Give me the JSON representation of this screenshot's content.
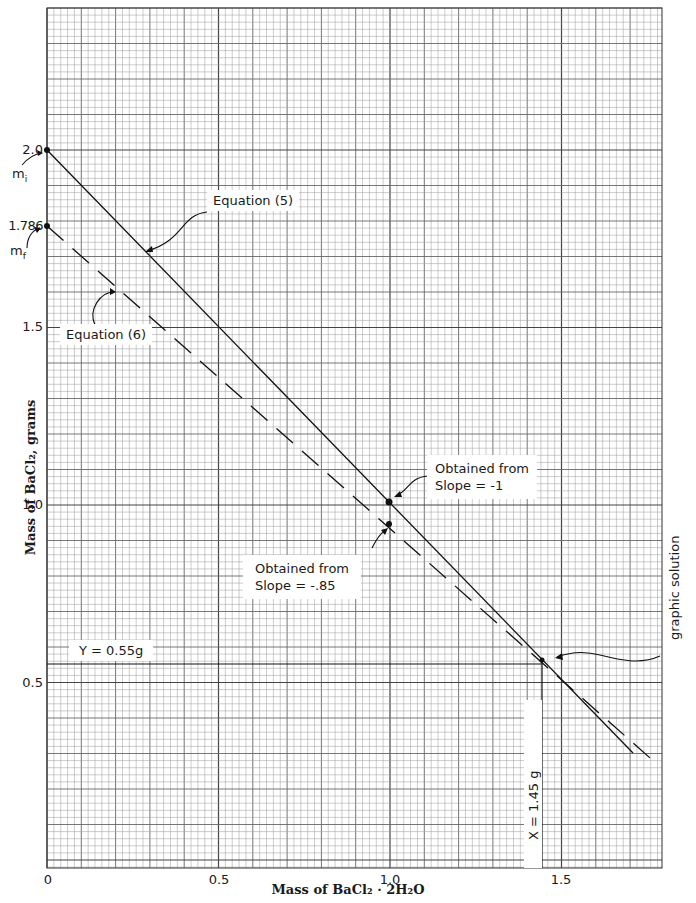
{
  "chart_data": {
    "type": "line",
    "title": "",
    "xlabel": "Mass of BaCl₂·2H₂O",
    "ylabel": "Mass of BaCl₂, grams",
    "xlim": [
      0,
      1.79
    ],
    "ylim": [
      0,
      2.42
    ],
    "grid": true,
    "x_ticks": [
      "0",
      "0.5",
      "1.0",
      "1.5"
    ],
    "x_tick_values": [
      0,
      0.5,
      1.0,
      1.5
    ],
    "y_ticks": [
      "0.5",
      "1.0",
      "1.5",
      "2.0"
    ],
    "y_tick_values": [
      0.5,
      1.0,
      1.5,
      2.0
    ],
    "series": [
      {
        "name": "Equation (5)",
        "style": "solid",
        "slope": -1,
        "intercept": 2.0,
        "x": [
          0,
          1.71
        ],
        "y": [
          2.0,
          0.29
        ]
      },
      {
        "name": "Equation (6)",
        "style": "dashed",
        "slope": -0.85,
        "intercept": 1.786,
        "x": [
          0,
          1.78
        ],
        "y": [
          1.786,
          0.273
        ]
      }
    ],
    "points": [
      {
        "x": 0,
        "y": 2.0,
        "label": "2.0"
      },
      {
        "x": 0,
        "y": 1.786,
        "label": "1.786"
      },
      {
        "x": 1.0,
        "y": 1.0
      },
      {
        "x": 1.0,
        "y": 0.936
      },
      {
        "x": 1.45,
        "y": 0.55
      }
    ],
    "annotations": [
      {
        "text": "mᵢ",
        "target": "2.0"
      },
      {
        "text": "mᶠ",
        "target": "1.786"
      },
      {
        "text": "Equation (5)"
      },
      {
        "text": "Equation (6)"
      },
      {
        "text": "Obtained from\nSlope = -1"
      },
      {
        "text": "Obtained from\nSlope = -.85"
      },
      {
        "text": "Y = 0.55g"
      },
      {
        "text": "X = 1.45 g"
      },
      {
        "text": "graphic solution"
      }
    ]
  },
  "labels": {
    "y_tick_2_0": "2.0",
    "y_tick_1_786": "1.786",
    "y_tick_1_5": "1.5",
    "y_tick_1_0": "1.0",
    "y_tick_0_5": "0.5",
    "x_tick_0": "0",
    "x_tick_0_5": "0.5",
    "x_tick_1_0": "1.0",
    "x_tick_1_5": "1.5",
    "m_i": "m",
    "m_i_sub": "i",
    "m_f": "m",
    "m_f_sub": "f",
    "eq5": "Equation (5)",
    "eq6": "Equation (6)",
    "obtained1_line1": "Obtained from",
    "obtained1_line2": "Slope = -1",
    "obtained2_line1": "Obtained from",
    "obtained2_line2": "Slope = -.85",
    "y_solution": "Y = 0.55g",
    "x_solution": "X = 1.45 g",
    "graphic_solution": "graphic solution",
    "ylabel": "Mass of BaCl₂, grams",
    "xlabel": "Mass of BaCl₂ · 2H₂O"
  }
}
